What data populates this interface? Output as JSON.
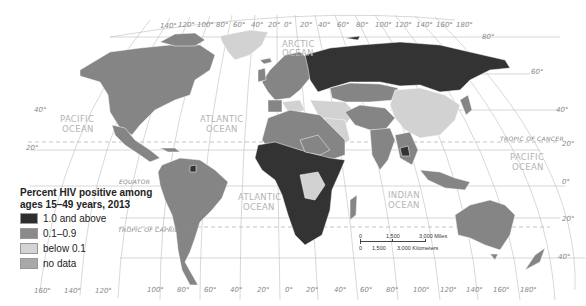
{
  "legend": {
    "title_line1": "Percent HIV positive among",
    "title_line2": "ages 15–49 years, 2013",
    "items": [
      {
        "label": "1.0 and above",
        "color": "#2e2e2e"
      },
      {
        "label": "0.1–0.9",
        "color": "#8a8a8a"
      },
      {
        "label": "below 0.1",
        "color": "#d4d4d4"
      },
      {
        "label": "no data",
        "color": "#a9a9a9"
      }
    ]
  },
  "oceans": {
    "arctic_1": "ARCTIC",
    "arctic_2": "OCEAN",
    "pacific_w_1": "PACIFIC",
    "pacific_w_2": "OCEAN",
    "atlantic_n_1": "ATLANTIC",
    "atlantic_n_2": "OCEAN",
    "atlantic_s_1": "ATLANTIC",
    "atlantic_s_2": "OCEAN",
    "indian_1": "INDIAN",
    "indian_2": "OCEAN",
    "pacific_e_1": "PACIFIC",
    "pacific_e_2": "OCEAN"
  },
  "lines": {
    "tropic_cancer": "TROPIC OF CANCER",
    "tropic_capricorn": "TROPIC OF CAPRICORN",
    "equator": "EQUATOR"
  },
  "top_longitudes": [
    "140°",
    "120°",
    "100°",
    "80°",
    "60°",
    "40°",
    "20°",
    "0°",
    "20°",
    "40°",
    "60°",
    "80°",
    "100°",
    "120°",
    "140°",
    "160°",
    "180°"
  ],
  "bottom_longitudes": [
    "160°",
    "140°",
    "120°",
    "100°",
    "80°",
    "60°",
    "40°",
    "20°",
    "0°",
    "20°",
    "40°",
    "60°",
    "80°",
    "100°",
    "120°",
    "140°",
    "160°",
    "180°"
  ],
  "left_latitudes": [
    "40°",
    "20°"
  ],
  "right_latitudes": [
    "80°",
    "60°",
    "40°",
    "20°",
    "0°",
    "20°",
    "40°"
  ],
  "scale": {
    "miles_0": "0",
    "miles_1": "1,500",
    "miles_2": "3,000 Miles",
    "km_0": "0",
    "km_1": "1,500",
    "km_2": "3,000 Kilometers"
  }
}
